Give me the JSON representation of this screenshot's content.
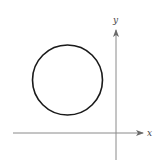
{
  "diagram": {
    "type": "coordinate-plane",
    "axes": {
      "x_label": "x",
      "y_label": "y",
      "color": "#8a8a8a",
      "origin": [
        116,
        133
      ]
    },
    "circle": {
      "center_px": [
        67.5,
        80
      ],
      "radius_px": 35,
      "stroke": "#1a1a1a",
      "stroke_width": 1.6,
      "quadrant": "II"
    }
  }
}
